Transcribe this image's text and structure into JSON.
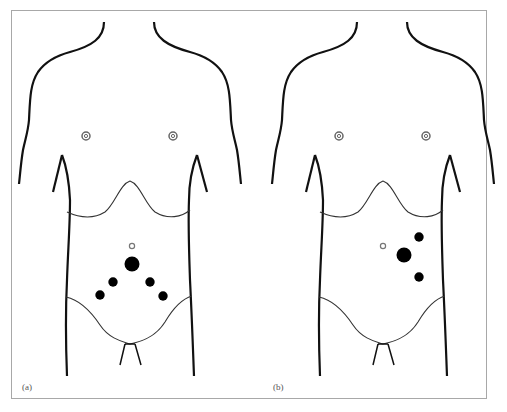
{
  "figure": {
    "panels": [
      {
        "id": "a",
        "label": "(a)",
        "port_layout": "diamond",
        "ports": 5
      },
      {
        "id": "b",
        "label": "(b)",
        "port_layout": "left-lateral",
        "ports": 3
      }
    ],
    "colors": {
      "outline": "#111111",
      "frame": "#a8a8a8",
      "port": "#000000",
      "nipple": "#666666"
    }
  }
}
